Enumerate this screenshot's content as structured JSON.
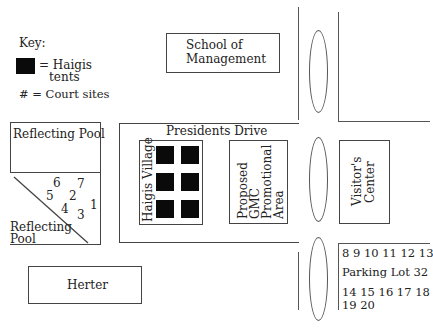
{
  "key": {
    "title": "Key:",
    "tent_label_line1": "= Haigis",
    "tent_label_line2": "tents",
    "court_label": "# = Court sites",
    "tent_icon": "black-square",
    "tent_color": "#0a0a0a"
  },
  "buildings": {
    "school_of_management": {
      "line1": "School of",
      "line2": "Management"
    },
    "reflecting_pool_upper": "Reflecting Pool",
    "reflecting_pool_lower": {
      "line1": "Reflecting",
      "line2": "Pool"
    },
    "presidents_drive": "Presidents Drive",
    "haigis_village": "Haigis Village",
    "gmc_area": {
      "line1": "Proposed",
      "line2": "GMC",
      "line3": "Promotional",
      "line4": "Area"
    },
    "visitors_center": {
      "line1": "Visitor's",
      "line2": "Center"
    },
    "herter": "Herter"
  },
  "court_sites_pool": [
    "6",
    "7",
    "5",
    "2",
    "1",
    "4",
    "3"
  ],
  "parking_lot": {
    "row1": "8 9 10 11 12 13",
    "name": "Parking Lot 32",
    "row2": "14 15 16 17 18",
    "row3": "19 20"
  },
  "haigis_tents_count": 6
}
